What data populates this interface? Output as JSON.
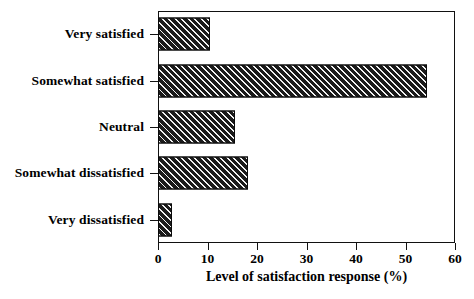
{
  "chart_data": {
    "type": "bar",
    "orientation": "horizontal",
    "title": "",
    "xlabel": "Level of satisfaction response (%)",
    "ylabel": "",
    "categories": [
      "Very satisfied",
      "Somewhat satisfied",
      "Neutral",
      "Somewhat dissatisfied",
      "Very dissatisfied"
    ],
    "values": [
      10.5,
      54.3,
      15.6,
      18.2,
      2.8
    ],
    "xlim": [
      0,
      60
    ],
    "xticks": [
      0,
      10,
      20,
      30,
      40,
      50,
      60
    ],
    "xtick_labels": [
      "0",
      "10",
      "20",
      "30",
      "40",
      "50",
      "60"
    ],
    "grid": false,
    "legend": false,
    "bar_fill_color": "#1b1b1b",
    "bar_hatch_color": "#f2f2f2",
    "bar_hatch": "diagonal-forward",
    "frame_color": "#111111",
    "background_color": "#ffffff"
  }
}
